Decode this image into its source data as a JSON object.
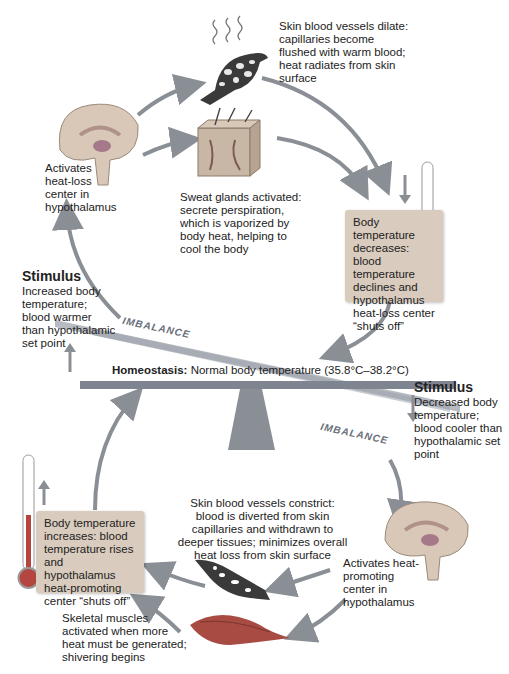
{
  "upper_loop": {
    "dilate_text": "Skin blood vessels dilate: capillaries become flushed with warm blood; heat radiates from skin surface",
    "brain_text": "Activates heat-loss center in hypothalamus",
    "sweat_text": "Sweat glands activated: secrete perspiration, which is vaporized by body heat, helping to cool the body",
    "result_box": "Body temperature decreases: blood temperature declines and hypothalamus heat-loss center “shuts off”"
  },
  "stimulus_increase": {
    "title": "Stimulus",
    "text": "Increased body temperature; blood warmer than hypothalamic set point"
  },
  "homeostasis": {
    "label": "Homeostasis:",
    "text": "Normal body temperature (35.8°C–38.2°C)",
    "imbalance_upper": "IMBALANCE",
    "imbalance_lower": "IMBALANCE"
  },
  "stimulus_decrease": {
    "title": "Stimulus",
    "text": "Decreased body temperature; blood cooler than hypothalamic set point"
  },
  "lower_loop": {
    "constrict_text": "Skin blood vessels constrict: blood is diverted from skin capillaries and withdrawn to deeper tissues; minimizes overall heat loss from skin surface",
    "brain_text": "Activates heat-promoting center in hypothalamus",
    "muscle_text": "Skeletal muscles activated when more heat must be generated; shivering begins",
    "result_box": "Body temperature increases: blood temperature rises and hypothalamus heat-promoting center “shuts off”"
  },
  "colors": {
    "arrow": "#8a8f96",
    "box": "#d9cbbd",
    "seesaw": "#7f8590",
    "thermometer_red": "#b5463f"
  }
}
